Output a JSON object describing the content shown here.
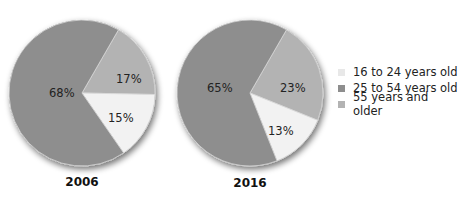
{
  "chart_data": [
    {
      "type": "pie",
      "title": "2006",
      "categories": [
        "16 to 24 years old",
        "25 to 54 years old",
        "55 years and older"
      ],
      "values": [
        15,
        68,
        17
      ],
      "labels": [
        "15%",
        "68%",
        "17%"
      ]
    },
    {
      "type": "pie",
      "title": "2016",
      "categories": [
        "16 to 24 years old",
        "25 to 54 years old",
        "55 years and older"
      ],
      "values": [
        13,
        65,
        23
      ],
      "labels": [
        "13%",
        "65%",
        "23%"
      ]
    }
  ],
  "colors": {
    "age_16_24": "#f2f2f2",
    "age_25_54": "#8e8e8e",
    "age_55_plus": "#b3b3b3"
  },
  "pies": {
    "p2006": {
      "year": "2006",
      "label_young": "15%",
      "label_mid": "68%",
      "label_old": "17%"
    },
    "p2016": {
      "year": "2016",
      "label_young": "13%",
      "label_mid": "65%",
      "label_old": "23%"
    }
  },
  "legend": {
    "items": [
      {
        "label": "16 to 24 years old"
      },
      {
        "label": "25 to 54 years old"
      },
      {
        "label": "55 years and older"
      }
    ]
  }
}
